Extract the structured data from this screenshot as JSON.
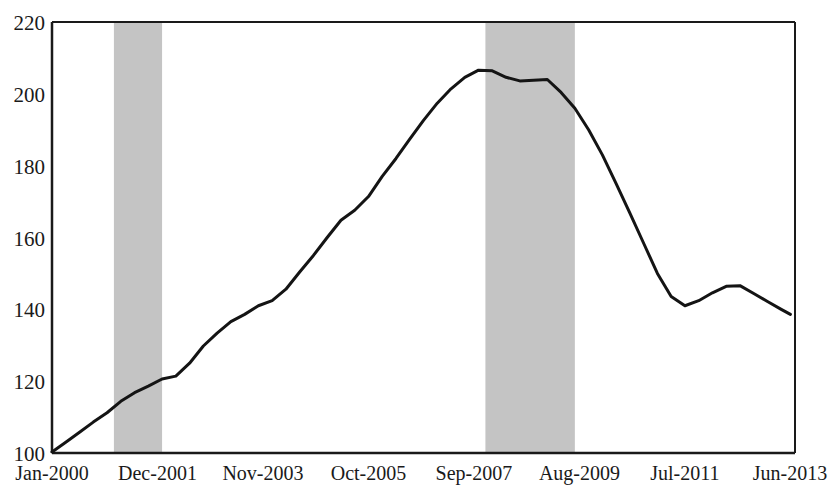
{
  "chart_data": {
    "type": "line",
    "title": "",
    "subtitle": "",
    "xlabel": "",
    "ylabel": "",
    "ylim": [
      100,
      220
    ],
    "xlim": [
      0,
      162
    ],
    "grid": false,
    "legend": null,
    "y_ticks": [
      100,
      120,
      140,
      160,
      180,
      200,
      220
    ],
    "y_tick_labels": [
      "100",
      "120",
      "140",
      "160",
      "180",
      "200",
      "220"
    ],
    "x_tick_labels": [
      "Jan-2000",
      "Dec-2001",
      "Nov-2003",
      "Oct-2005",
      "Sep-2007",
      "Aug-2009",
      "Jul-2011",
      "Jun-2013"
    ],
    "x_tick_positions": [
      0,
      23,
      46,
      69,
      92,
      115,
      138,
      161
    ],
    "line_color": "#141414",
    "line_width": 3,
    "shaded_band_color": "#c4c4c4",
    "shaded_bands": [
      {
        "label": "recession-band-1",
        "x_start": 13.5,
        "x_end": 24.0
      },
      {
        "label": "recession-band-2",
        "x_start": 94.5,
        "x_end": 114.0
      }
    ],
    "series": [
      {
        "name": "index",
        "x": [
          0,
          3,
          6,
          9,
          12,
          15,
          18,
          21,
          24,
          27,
          30,
          33,
          36,
          39,
          42,
          45,
          48,
          51,
          54,
          57,
          60,
          63,
          66,
          69,
          72,
          75,
          78,
          81,
          84,
          87,
          90,
          93,
          96,
          99,
          102,
          105,
          108,
          111,
          114,
          117,
          120,
          123,
          126,
          129,
          132,
          135,
          138,
          141,
          144,
          147,
          150,
          153,
          156,
          159,
          161
        ],
        "values": [
          100.3,
          103.0,
          105.8,
          108.6,
          111.2,
          114.4,
          116.8,
          118.6,
          120.6,
          121.4,
          125.0,
          129.8,
          133.4,
          136.6,
          138.6,
          141.0,
          142.4,
          145.6,
          150.4,
          155.0,
          160.0,
          164.8,
          167.6,
          171.4,
          177.0,
          182.0,
          187.4,
          192.6,
          197.4,
          201.4,
          204.6,
          206.6,
          206.4,
          204.6,
          203.6,
          203.8,
          204.0,
          200.4,
          196.0,
          190.0,
          183.0,
          175.0,
          166.8,
          158.4,
          150.0,
          143.6,
          141.0,
          142.4,
          144.6,
          146.4,
          146.6,
          144.4,
          142.2,
          140.0,
          138.6
        ]
      }
    ],
    "series_annotated_points": {
      "start_value": 100.3,
      "peak_value": 206.6,
      "trough_value": 141.0,
      "end_value": 159.4,
      "secondary_peak_value": 146.6,
      "secondary_trough_value": 137.0
    }
  }
}
